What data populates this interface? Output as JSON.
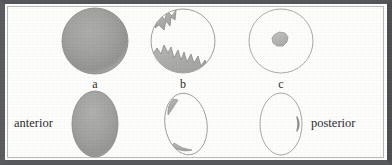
{
  "figure": {
    "background_color": "#fdfdfc",
    "frame_color": "#55565a",
    "ink_color": "#2e2e2e",
    "fill_gray": "#9a9a99",
    "outline_gray": "#8d8d8c"
  },
  "panel_labels": [
    {
      "id": "a",
      "text": "a"
    },
    {
      "id": "b",
      "text": "b"
    },
    {
      "id": "c",
      "text": "c"
    }
  ],
  "side_labels": {
    "left": "anterior",
    "right": "posterior"
  },
  "top_row": [
    {
      "id": "a",
      "shape": "circle",
      "fill": "fully-shaded",
      "description": "circle uniformly filled with gray radial shading"
    },
    {
      "id": "b",
      "shape": "circle",
      "fill": "partially-shaded",
      "description": "outlined circle with jagged gray wedge at upper left and jagged sawtooth gray band along lower left"
    },
    {
      "id": "c",
      "shape": "circle",
      "fill": "spot-shaded",
      "description": "outlined circle with one small irregular gray blob near the centre"
    }
  ],
  "bottom_row": [
    {
      "id": "a",
      "shape": "ellipse",
      "fill": "fully-shaded",
      "description": "vertical ellipse uniformly filled with gray radial shading"
    },
    {
      "id": "b",
      "shape": "ellipse",
      "fill": "edge-shaded",
      "description": "tilted outlined ellipse with thin gray crescent slivers at upper left and lower right of the rim"
    },
    {
      "id": "c",
      "shape": "ellipse",
      "fill": "spot-shaded",
      "description": "outlined ellipse with a small gray mark on the right rim"
    }
  ]
}
